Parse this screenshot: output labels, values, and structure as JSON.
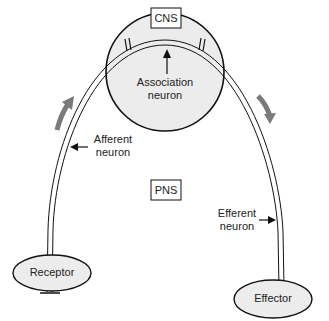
{
  "diagram": {
    "cns_label": "CNS",
    "pns_label": "PNS",
    "association_label_1": "Association",
    "association_label_2": "neuron",
    "afferent_label_1": "Afferent",
    "afferent_label_2": "neuron",
    "efferent_label_1": "Efferent",
    "efferent_label_2": "neuron",
    "receptor_label": "Receptor",
    "effector_label": "Effector",
    "colors": {
      "circle_fill": "#ececec",
      "outline": "#111111",
      "flow_arrow": "#7a7a7a"
    }
  }
}
